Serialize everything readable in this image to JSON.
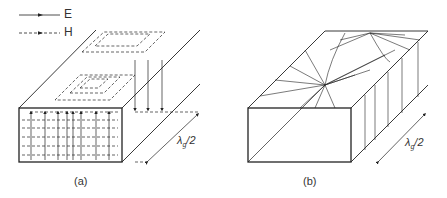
{
  "legend": {
    "items": [
      {
        "symbol": "solid-arrow-line",
        "label": "E"
      },
      {
        "symbol": "dashed-arrow-line",
        "label": "H"
      }
    ]
  },
  "figures": [
    {
      "id": "a",
      "caption": "(a)",
      "dimension_label": "λ",
      "dimension_sub": "g",
      "dimension_suffix": "/2"
    },
    {
      "id": "b",
      "caption": "(b)",
      "dimension_label": "λ",
      "dimension_sub": "g",
      "dimension_suffix": "/2"
    }
  ],
  "colors": {
    "line": "#222222",
    "background": "#ffffff"
  }
}
